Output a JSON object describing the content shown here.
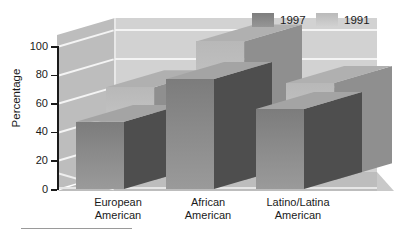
{
  "chart_data": {
    "type": "bar",
    "title": "",
    "subtitle": "",
    "xlabel": "",
    "ylabel": "Percentage",
    "ylim": [
      0,
      100
    ],
    "ytick_values": [
      100,
      80,
      60,
      40,
      20,
      0
    ],
    "ytick_labels": [
      "100",
      "80",
      "60",
      "40",
      "20",
      "0"
    ],
    "grid": true,
    "grid_axis": "y",
    "legend_position": "top-right",
    "projection": "3d",
    "categories": [
      "European American",
      "African American",
      "Latino/Latina American"
    ],
    "category_labels": [
      {
        "line1": "European",
        "line2": "American"
      },
      {
        "line1": "African",
        "line2": "American"
      },
      {
        "line1": "Latino/Latina",
        "line2": "American"
      }
    ],
    "series": [
      {
        "name": "1991",
        "color": "#c6c6c6",
        "top_color": "#b0b0b0",
        "side_color": "#8f8f8f",
        "values": [
          65,
          97,
          68
        ]
      },
      {
        "name": "1997",
        "color": "#8a8a8a",
        "top_color": "#a4a4a4",
        "side_color": "#4e4e4e",
        "values": [
          47,
          77,
          56
        ]
      }
    ]
  },
  "legend": {
    "items": [
      {
        "label": "1997",
        "color": "#8a8a8a"
      },
      {
        "label": "1991",
        "color": "#c6c6c6"
      }
    ]
  },
  "colors": {
    "back_wall": "#d2d2d2",
    "left_wall": "#bdbdbd",
    "floor": "#bdbdbd",
    "gridline": "#f4f4f4",
    "axis": "#1a1a1a",
    "text": "#1a1a1a",
    "background": "#ffffff"
  }
}
